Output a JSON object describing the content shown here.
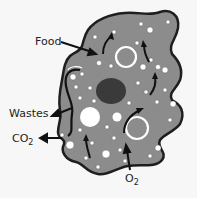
{
  "diagram": {
    "labels": {
      "food": "Food",
      "wastes": "Wastes",
      "co2_main": "CO",
      "co2_sub": "2",
      "o2_main": "O",
      "o2_sub": "2"
    },
    "colors": {
      "background": "#f7f7f7",
      "cytoplasm": "#8c8c8c",
      "outline": "#1e1e1e",
      "nucleus": "#3a3a3a",
      "vacuole": "#ffffff",
      "arrow": "#111111",
      "text": "#222222"
    }
  }
}
